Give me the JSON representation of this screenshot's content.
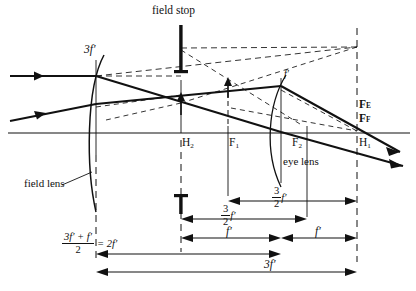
{
  "figure": {
    "type": "optical-ray-diagram",
    "background": "#ffffff",
    "ink": "#111111"
  },
  "labels": {
    "field_stop": "field stop",
    "field_lens": "field lens",
    "eye_lens": "eye lens",
    "field_lens_focal": "3f′",
    "eye_lens_focal": "f′",
    "principal_plane_h2": "H",
    "principal_plane_h2_sub": "2",
    "focal_f1": "F",
    "focal_f1_sub": "1",
    "focal_f2": "F",
    "focal_f2_sub": "2",
    "principal_plane_h1": "H",
    "principal_plane_h1_sub": "1",
    "focal_fe": "F",
    "focal_fe_sub": "E",
    "focal_ff": "F",
    "focal_ff_sub": "F"
  },
  "dimensions": [
    {
      "name": "three-halves-f-upper",
      "numerator": "3",
      "denominator": "2",
      "symbol": "f′",
      "text": "3/2 f′",
      "from": "F1",
      "to": "H1"
    },
    {
      "name": "three-halves-f-lower",
      "numerator": "3",
      "denominator": "2",
      "symbol": "f′",
      "text": "3/2 f′",
      "from": "H2",
      "to": "F2"
    },
    {
      "name": "f-prime-left",
      "text": "f′",
      "from": "H2",
      "to": "eye-lens"
    },
    {
      "name": "f-prime-right",
      "text": "f′",
      "from": "eye-lens",
      "to": "H1"
    },
    {
      "name": "equivalent-focal-length",
      "numerator": "3f′ + f′",
      "denominator": "2",
      "equals": "= 2f′",
      "text": "(3f′ + f′)/2 = 2f′",
      "from": "field-lens",
      "to": "eye-lens"
    },
    {
      "name": "total-separation",
      "text": "3f′",
      "from": "field-lens",
      "to": "H1"
    }
  ],
  "geometry": {
    "axis_y": 133,
    "field_lens_x": 96,
    "field_stop_x": 181,
    "h2_x": 181,
    "f1_x": 228,
    "eye_lens_x": 281,
    "f2_x": 307,
    "h1_x": 357,
    "right_edge_x": 357
  },
  "elements": {
    "incoming_rays": 2,
    "outgoing_rays": 2,
    "lens_count": 2,
    "field_stop_bars": 2,
    "construction_lines": "dashed"
  }
}
